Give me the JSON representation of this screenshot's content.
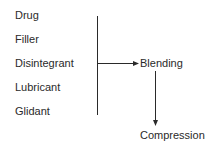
{
  "inputs": [
    {
      "label": "Drug"
    },
    {
      "label": "Filler"
    },
    {
      "label": "Disintegrant"
    },
    {
      "label": "Lubricant"
    },
    {
      "label": "Glidant"
    }
  ],
  "steps": {
    "blending": "Blending",
    "compression": "Compression"
  },
  "colors": {
    "line": "#2a2a2a",
    "text": "#2a2a2a"
  }
}
